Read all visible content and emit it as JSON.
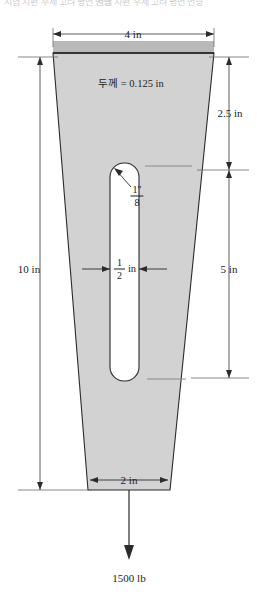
{
  "figure": {
    "title_strip": "시험 시편 우세 고려 평면 변형",
    "shape": "tapered-plate-with-central-slot",
    "colors": {
      "plate_fill": "#d2d2d2",
      "plate_edge": "#2b2b2b",
      "clamp_band": "#b9b9b9",
      "dimension_line": "#5a5a5a",
      "slot_fill": "#ffffff",
      "text": "#1d1d1d"
    },
    "dimensions": {
      "top_width": "4 in",
      "bottom_width": "2 in",
      "total_height": "10 in",
      "upper_segment": "2.5 in",
      "lower_segment": "5 in",
      "thickness": "두께 = 0.125 in",
      "slot_width_numerator": "1",
      "slot_width_denominator": "2",
      "slot_width_unit": "in",
      "fillet_numerator": "1″",
      "fillet_denominator": "8"
    },
    "load": {
      "magnitude": "1500 lb",
      "direction": "downward"
    }
  }
}
